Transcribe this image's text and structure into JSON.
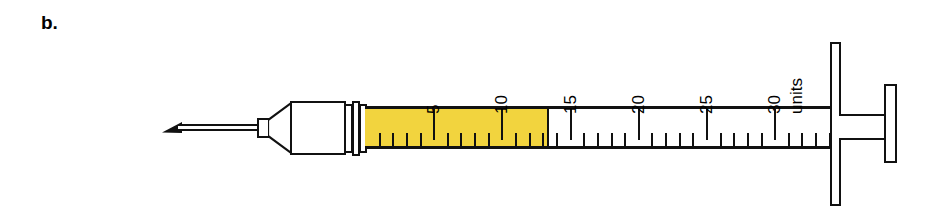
{
  "figure": {
    "panel_label": "b.",
    "kind": "insulin-syringe-illustration",
    "background_color": "#ffffff",
    "outline_color": "#111111",
    "fill_color": "#F2D43E"
  },
  "syringe": {
    "needle": {
      "label": "needle"
    },
    "hub": {
      "label": "needle hub"
    },
    "barrel": {
      "label": "barrel"
    },
    "plunger": {
      "label": "plunger"
    },
    "units_label": "units",
    "dose_units": 13.4
  },
  "scale": {
    "unit_label": "units",
    "major_ticks": [
      {
        "value": 5,
        "label": "5"
      },
      {
        "value": 10,
        "label": "10"
      },
      {
        "value": 15,
        "label": "15"
      },
      {
        "value": 20,
        "label": "20"
      },
      {
        "value": 25,
        "label": "25"
      },
      {
        "value": 30,
        "label": "30"
      }
    ],
    "minor_tick_values": [
      1,
      2,
      3,
      4,
      6,
      7,
      8,
      9,
      11,
      12,
      13,
      14,
      16,
      17,
      18,
      19,
      21,
      22,
      23,
      24,
      26,
      27,
      28,
      29,
      31,
      32,
      33,
      34
    ],
    "min": 0,
    "max": 34,
    "px_per_unit": 13.64,
    "origin_x": 366
  },
  "chart_data": {
    "type": "bar",
    "xlabel": "units",
    "ylabel": "",
    "categories": [
      "filled dose"
    ],
    "values": [
      13.4
    ],
    "ylim": [
      0,
      34
    ],
    "annotations": [
      "b.",
      "units"
    ],
    "tick_labels": [
      "5",
      "10",
      "15",
      "20",
      "25",
      "30"
    ]
  }
}
